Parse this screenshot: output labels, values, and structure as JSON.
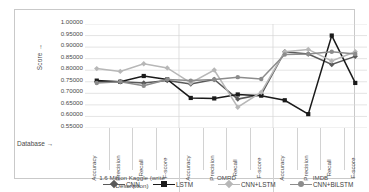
{
  "axis": {
    "y_label": "Score →",
    "x_label": "Database →",
    "y_ticks": [
      "1.00000",
      "0.95000",
      "0.90000",
      "0.85000",
      "0.80000",
      "0.75000",
      "0.70000",
      "0.65000",
      "0.60000",
      "0.55000"
    ]
  },
  "databases": [
    {
      "name": "1.6 Million Kaggle (write Description)"
    },
    {
      "name": "OMRD"
    },
    {
      "name": "IMDB"
    }
  ],
  "metrics": [
    "Accuracy",
    "Precision",
    "Recall",
    "F-score"
  ],
  "colors": {
    "cnn": "#595959",
    "lstm": "#1a1a1a",
    "cnn_lstm": "#b7b7b7",
    "cnn_bilstm": "#8c8c8c",
    "grid": "#d9d9d9",
    "border": "#c9c9c9"
  },
  "chart_data": {
    "type": "line",
    "title": "",
    "xlabel": "Database →",
    "ylabel": "Score →",
    "ylim": [
      0.55,
      1.0
    ],
    "ytick_step": 0.05,
    "grid": true,
    "legend_position": "bottom",
    "categories": [
      "Accuracy",
      "Precision",
      "Recall",
      "F-score",
      "Accuracy",
      "Precision",
      "Recall",
      "F-score",
      "Accuracy",
      "Precision",
      "Recall",
      "F-score"
    ],
    "category_groups": [
      {
        "label": "1.6 Million Kaggle (write Description)",
        "span": 4
      },
      {
        "label": "OMRD",
        "span": 4
      },
      {
        "label": "IMDB",
        "span": 4
      }
    ],
    "series": [
      {
        "name": "CNN",
        "color": "#595959",
        "marker": "diamond",
        "values": [
          0.75,
          0.75,
          0.745,
          0.755,
          0.74,
          0.76,
          0.675,
          0.695,
          0.88,
          0.87,
          0.825,
          0.86
        ]
      },
      {
        "name": "LSTM",
        "color": "#1a1a1a",
        "marker": "square",
        "values": [
          0.755,
          0.75,
          0.775,
          0.76,
          0.68,
          0.678,
          0.695,
          0.69,
          0.67,
          0.61,
          0.95,
          0.745
        ]
      },
      {
        "name": "CNN+LSTM",
        "color": "#b7b7b7",
        "marker": "diamond",
        "values": [
          0.807,
          0.795,
          0.828,
          0.81,
          0.745,
          0.801,
          0.64,
          0.705,
          0.88,
          0.89,
          0.84,
          0.88
        ]
      },
      {
        "name": "CNN+BiLSTM",
        "color": "#8c8c8c",
        "marker": "circle",
        "values": [
          0.745,
          0.75,
          0.733,
          0.76,
          0.755,
          0.76,
          0.77,
          0.762,
          0.868,
          0.87,
          0.88,
          0.87
        ]
      }
    ]
  },
  "legend": [
    {
      "label": "CNN"
    },
    {
      "label": "LSTM"
    },
    {
      "label": "CNN+LSTM"
    },
    {
      "label": "CNN+BiLSTM"
    }
  ]
}
